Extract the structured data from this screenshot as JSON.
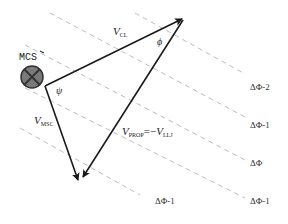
{
  "diagram": {
    "marker": {
      "label": "MCS",
      "icon": "crossed-circle-icon"
    },
    "vectors": [
      {
        "id": "v_cl",
        "symbol": "V",
        "subscript": "CL"
      },
      {
        "id": "v_msc",
        "symbol": "V",
        "subscript": "MSC"
      },
      {
        "id": "v_prop",
        "symbol": "V",
        "subscript": "PROP",
        "equals": "=−",
        "rhs_symbol": "V",
        "rhs_subscript": "LLJ"
      }
    ],
    "angles": {
      "psi": "ψ",
      "phi": "ϕ"
    },
    "phase_lines": [
      {
        "label": "ΔΦ-2"
      },
      {
        "label": "ΔΦ-1"
      },
      {
        "label": "ΔΦ"
      },
      {
        "label": "ΔΦ-1"
      },
      {
        "label": "ΔΦ-1"
      }
    ],
    "colors": {
      "vector": "#1a1a1a",
      "dashed": "#bdbdbd",
      "marker_fill": "#7a7a7a"
    }
  }
}
